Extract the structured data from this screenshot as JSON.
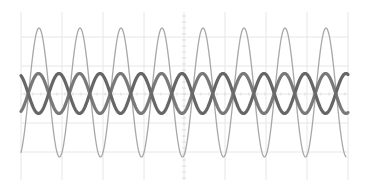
{
  "chart_data": {
    "type": "line",
    "title": "",
    "xlabel": "",
    "ylabel": "",
    "grid": true,
    "legend": null,
    "plot_area_px": {
      "x0": 21,
      "x1": 348,
      "y0": 8,
      "y1": 180
    },
    "grid_px": {
      "vertical": [
        21,
        62,
        103,
        144,
        184,
        225,
        266,
        307,
        348
      ],
      "horizontal": [
        37,
        66,
        94,
        123,
        152
      ],
      "center_ticks_x": 184,
      "color": "#e6e6e6"
    },
    "xlim": [
      0,
      8
    ],
    "ylim": [
      -4,
      4
    ],
    "series": [
      {
        "name": "trace-1-large-sine",
        "color": "#a8a8a8",
        "stroke_width": 1.3,
        "center_px_y": 92.5,
        "amplitude_px": 64.5,
        "period_px": 41,
        "phase_peak_px_x": 39,
        "x_start_px": 21,
        "x_end_px": 346,
        "peaks_px_x": [
          39,
          79,
          119,
          160,
          200,
          243,
          285,
          326
        ]
      },
      {
        "name": "trace-2-small-sine",
        "color": "#555555",
        "stroke_width": 3.2,
        "center_px_y": 93.5,
        "amplitude_px": 20,
        "period_px": 41,
        "phase_peak_px_x": 59,
        "x_start_px": 21,
        "x_end_px": 348
      },
      {
        "name": "trace-3-small-sine-inverted",
        "color": "#6a6a6a",
        "stroke_width": 3.2,
        "center_px_y": 93.5,
        "amplitude_px": 20,
        "period_px": 41,
        "phase_peak_px_x": 38.5,
        "x_start_px": 21,
        "x_end_px": 348
      }
    ]
  }
}
